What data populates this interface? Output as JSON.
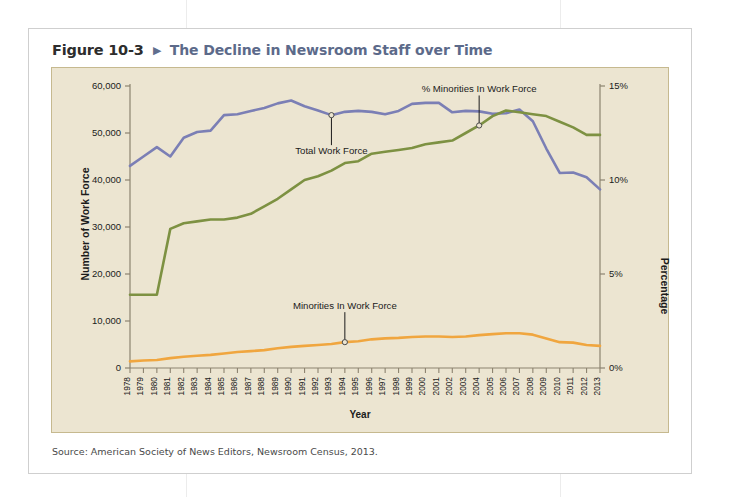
{
  "figure": {
    "number_label": "Figure 10-3",
    "arrow_glyph": "▶",
    "title": "The Decline in Newsroom Staff over Time",
    "source": "Source: American Society of News Editors, Newsroom Census, 2013."
  },
  "colors": {
    "plot_background": "#ece5d1",
    "plot_border": "#c6b98f",
    "title_blue": "#5c6a8a",
    "total_work_force": "#7b7fb5",
    "pct_minorities": "#7d9142",
    "minorities": "#f0a63f",
    "axis": "#8c8370",
    "text": "#1b1b1b"
  },
  "chart_data": {
    "type": "line",
    "title": "The Decline in Newsroom Staff over Time",
    "xlabel": "Year",
    "ylabel": "Number of Work Force",
    "ylabel_right": "Percentage",
    "ylim": [
      0,
      60000
    ],
    "ylim_right": [
      0,
      15
    ],
    "yticks": [
      0,
      10000,
      20000,
      30000,
      40000,
      50000,
      60000
    ],
    "ytick_labels": [
      "0",
      "10,000",
      "20,000",
      "30,000",
      "40,000",
      "50,000",
      "60,000"
    ],
    "yticks_right": [
      0,
      5,
      10,
      15
    ],
    "ytick_labels_right": [
      "0%",
      "5%",
      "10%",
      "15%"
    ],
    "grid": false,
    "legend": "annotations",
    "x": [
      1978,
      1979,
      1980,
      1981,
      1982,
      1983,
      1984,
      1985,
      1986,
      1987,
      1988,
      1989,
      1990,
      1991,
      1992,
      1993,
      1994,
      1995,
      1996,
      1997,
      1998,
      1999,
      2000,
      2001,
      2002,
      2003,
      2004,
      2005,
      2006,
      2007,
      2008,
      2009,
      2010,
      2011,
      2012,
      2013
    ],
    "xtick_labels": [
      "1978",
      "1979",
      "1980",
      "1981",
      "1982",
      "1983",
      "1984",
      "1985",
      "1986",
      "1987",
      "1988",
      "1989",
      "1990",
      "1991",
      "1992",
      "1993",
      "1994",
      "1995",
      "1996",
      "1997",
      "1998",
      "1999",
      "2000",
      "2001",
      "2002",
      "2003",
      "2004",
      "2005",
      "2006",
      "2007",
      "2008",
      "2009",
      "2010",
      "2011",
      "2012",
      "2013"
    ],
    "series": [
      {
        "name": "Total Work Force",
        "color": "#7b7fb5",
        "axis": "left",
        "unit": "people",
        "values": [
          43000,
          45000,
          47000,
          45000,
          49000,
          50200,
          50500,
          53800,
          54000,
          54700,
          55300,
          56300,
          56900,
          55700,
          54800,
          53800,
          54500,
          54700,
          54500,
          54000,
          54700,
          56200,
          56400,
          56400,
          54400,
          54700,
          54600,
          54100,
          54200,
          55000,
          52500,
          46700,
          41500,
          41600,
          40600,
          38000
        ]
      },
      {
        "name": "% Minorities In Work Force",
        "color": "#7d9142",
        "axis": "right",
        "unit": "percent",
        "values": [
          3.9,
          3.9,
          3.9,
          7.4,
          7.7,
          7.8,
          7.9,
          7.9,
          8.0,
          8.2,
          8.6,
          9.0,
          9.5,
          10.0,
          10.2,
          10.5,
          10.9,
          11.0,
          11.4,
          11.5,
          11.6,
          11.7,
          11.9,
          12.0,
          12.1,
          12.5,
          12.9,
          13.4,
          13.7,
          13.6,
          13.5,
          13.4,
          13.1,
          12.8,
          12.4,
          12.4
        ]
      },
      {
        "name": "Minorities In Work Force",
        "color": "#f0a63f",
        "axis": "left",
        "unit": "people",
        "values": [
          1400,
          1600,
          1700,
          2100,
          2400,
          2600,
          2800,
          3100,
          3400,
          3600,
          3800,
          4200,
          4500,
          4700,
          4900,
          5100,
          5500,
          5700,
          6100,
          6300,
          6400,
          6600,
          6700,
          6700,
          6600,
          6700,
          7000,
          7200,
          7400,
          7400,
          7100,
          6300,
          5500,
          5400,
          4900,
          4700
        ]
      }
    ],
    "annotations": [
      {
        "text": "Total Work Force",
        "x": 1993,
        "y": 53800,
        "axis": "left",
        "leader": "up"
      },
      {
        "text": "% Minorities In Work Force",
        "x": 2004,
        "y": 12.9,
        "axis": "right",
        "leader": "down"
      },
      {
        "text": "Minorities In Work Force",
        "x": 1994,
        "y": 5500,
        "axis": "left",
        "leader": "down"
      }
    ]
  }
}
